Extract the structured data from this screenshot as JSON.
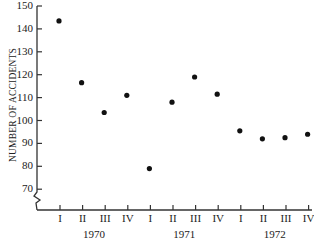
{
  "chart_data": {
    "type": "scatter",
    "title": "",
    "xlabel": "",
    "ylabel": "NUMBER OF ACCIDENTS",
    "ylim": [
      60,
      150
    ],
    "yticks": [
      70,
      80,
      90,
      100,
      110,
      120,
      130,
      140,
      150
    ],
    "axis_break": true,
    "grid": false,
    "legend": null,
    "categories": [
      "1970 I",
      "1970 II",
      "1970 III",
      "1970 IV",
      "1971 I",
      "1971 II",
      "1971 III",
      "1971 IV",
      "1972 I",
      "1972 II",
      "1972 III",
      "1972 IV"
    ],
    "quarter_labels": [
      "I",
      "II",
      "III",
      "IV",
      "I",
      "II",
      "III",
      "IV",
      "I",
      "II",
      "III",
      "IV"
    ],
    "year_labels": [
      "1970",
      "1971",
      "1972"
    ],
    "values": [
      143.5,
      116.5,
      103.5,
      111,
      79,
      108,
      119,
      111.5,
      95.5,
      92,
      92.5,
      94
    ]
  }
}
